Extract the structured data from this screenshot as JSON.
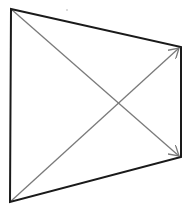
{
  "diagram": {
    "type": "quadrilateral-with-diagonal-arrows",
    "width": 186,
    "height": 211,
    "background": "#ffffff",
    "vertices": {
      "top_left": [
        11,
        9
      ],
      "top_right": [
        181,
        47
      ],
      "bottom_right": [
        181,
        157
      ],
      "bottom_left": [
        10,
        202
      ]
    },
    "outline": {
      "color": "#1a1a1a",
      "stroke_width": 2
    },
    "arrows": [
      {
        "id": "arrow-top-left-to-bottom-right",
        "from": [
          11,
          9
        ],
        "to": [
          179,
          156
        ],
        "color": "#7a7a7a",
        "stroke_width": 1.3
      },
      {
        "id": "arrow-bottom-left-to-top-right",
        "from": [
          10,
          202
        ],
        "to": [
          179,
          48
        ],
        "color": "#7a7a7a",
        "stroke_width": 1.3
      }
    ],
    "intersection": [
      117,
      104
    ],
    "speck": {
      "position": [
        67,
        10
      ],
      "color": "#b0b0b0"
    }
  }
}
